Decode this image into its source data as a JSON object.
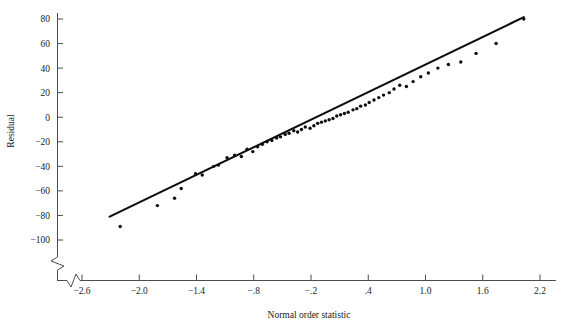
{
  "chart_data": {
    "type": "scatter",
    "title": "",
    "subtitle": "",
    "xlabel": "Normal order statistic",
    "ylabel": "Residual",
    "xlim": [
      -2.65,
      2.3
    ],
    "ylim": [
      -105,
      85
    ],
    "grid": false,
    "legend": "none",
    "axis_break": {
      "x_axis": true,
      "y_axis": true,
      "note": "zigzag break symbols at lower-left origin corner on both axes"
    },
    "xticks": [
      -2.6,
      -2.0,
      -1.4,
      -0.8,
      -0.2,
      0.4,
      1.0,
      1.6,
      2.2
    ],
    "xticklabels": [
      "−2.6",
      "−2.0",
      "−1.4",
      "−.8",
      "−.2",
      ".4",
      "1.0",
      "1.6",
      "2.2"
    ],
    "yticks": [
      80,
      60,
      40,
      20,
      0,
      -20,
      -40,
      -60,
      -80,
      -100
    ],
    "yticklabels": [
      "80",
      "60",
      "40",
      "20",
      "0",
      "−20",
      "−40",
      "−60",
      "−80",
      "−100"
    ],
    "series": [
      {
        "name": "Residuals vs normal order statistic",
        "marker": "dot",
        "color": "#0d0d0d",
        "x": [
          -2.2,
          -1.81,
          -1.63,
          -1.56,
          -1.41,
          -1.34,
          -1.22,
          -1.17,
          -1.08,
          -1.0,
          -0.93,
          -0.87,
          -0.81,
          -0.76,
          -0.71,
          -0.66,
          -0.61,
          -0.56,
          -0.52,
          -0.47,
          -0.43,
          -0.38,
          -0.34,
          -0.3,
          -0.26,
          -0.21,
          -0.17,
          -0.13,
          -0.09,
          -0.05,
          -0.01,
          0.03,
          0.07,
          0.11,
          0.15,
          0.19,
          0.24,
          0.28,
          0.32,
          0.37,
          0.41,
          0.46,
          0.51,
          0.56,
          0.62,
          0.67,
          0.73,
          0.8,
          0.87,
          0.95,
          1.03,
          1.13,
          1.24,
          1.37,
          1.53,
          1.74,
          2.03
        ],
        "y": [
          -89.0,
          -72.0,
          -66.0,
          -58.0,
          -46.0,
          -47.0,
          -40.0,
          -39.0,
          -33.0,
          -31.0,
          -32.0,
          -26.0,
          -28.0,
          -24.0,
          -22.0,
          -20.0,
          -19.0,
          -17.0,
          -16.0,
          -14.0,
          -13.0,
          -11.0,
          -12.0,
          -10.0,
          -8.0,
          -9.0,
          -7.0,
          -5.0,
          -4.0,
          -3.0,
          -2.0,
          -1.0,
          1.0,
          2.0,
          3.0,
          4.0,
          6.0,
          7.0,
          9.0,
          10.0,
          12.0,
          14.0,
          16.0,
          18.0,
          20.0,
          23.0,
          26.0,
          25.0,
          29.0,
          33.0,
          36.0,
          40.0,
          43.0,
          45.0,
          52.0,
          60.0,
          80.0
        ]
      }
    ],
    "reference_line": {
      "name": "fitted normal reference line",
      "x": [
        -2.31,
        2.03
      ],
      "y": [
        -81.0,
        81.5
      ]
    }
  },
  "axis_labels": {
    "x_title": "Normal order statistic",
    "y_title": "Residual"
  }
}
